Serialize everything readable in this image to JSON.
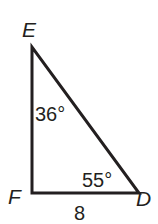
{
  "diagram": {
    "type": "right-triangle",
    "stroke_color": "#231f20",
    "background": "#ffffff",
    "vertices": {
      "E": {
        "label": "E",
        "x": 32,
        "y": 47
      },
      "F": {
        "label": "F",
        "x": 32,
        "y": 193
      },
      "D": {
        "label": "D",
        "x": 139,
        "y": 193
      }
    },
    "angles": {
      "E": "36°",
      "D": "55°"
    },
    "sides": {
      "FD": "8"
    }
  }
}
